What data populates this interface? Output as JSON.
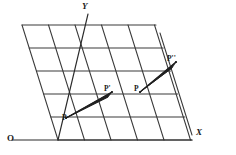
{
  "figure": {
    "background_color": "#ffffff",
    "stroke_color": "#2b2b2b",
    "label_color": "#1a1a1a"
  },
  "axes": {
    "origin_label": "O",
    "x_label": "X",
    "y_label": "Y",
    "origin_point": {
      "x": 58,
      "y": 140
    },
    "x_axis_end": {
      "x": 192,
      "y": 140
    },
    "y_axis_end": {
      "x": 90,
      "y": 14
    },
    "x_label_pos": {
      "x": 196,
      "y": 129
    },
    "y_label_pos": {
      "x": 82,
      "y": 3
    },
    "origin_label_pos": {
      "x": 7,
      "y": 135
    }
  },
  "grid": {
    "type": "oblique-parallelogram-lattice",
    "rows": 5,
    "columns": 6,
    "cell_width": 26.5,
    "row_height": 23,
    "slant_dx": -7.2,
    "base_y": 140,
    "base_x_start": 58,
    "horizontal_line_count": 5,
    "slanted_line_count": 7
  },
  "points": [
    {
      "id": "P",
      "label": "P",
      "px": 66,
      "py": 118,
      "label_x": 62,
      "label_y": 115
    },
    {
      "id": "P1",
      "label": "P'",
      "px": 112,
      "py": 92,
      "label_x": 105,
      "label_y": 86
    },
    {
      "id": "P2",
      "label": "P",
      "px": 140,
      "py": 92,
      "label_x": 134,
      "label_y": 86
    },
    {
      "id": "P3",
      "label": "P''",
      "px": 176,
      "py": 62,
      "label_x": 168,
      "label_y": 56
    }
  ],
  "vectors": [
    {
      "id": "vec-P-to-P1",
      "from": "P",
      "to": "P1",
      "from_x": 66,
      "from_y": 118,
      "to_x": 112,
      "to_y": 92
    },
    {
      "id": "vec-P2-to-P3",
      "from": "P2",
      "to": "P3",
      "from_x": 140,
      "from_y": 92,
      "to_x": 176,
      "to_y": 62
    }
  ]
}
